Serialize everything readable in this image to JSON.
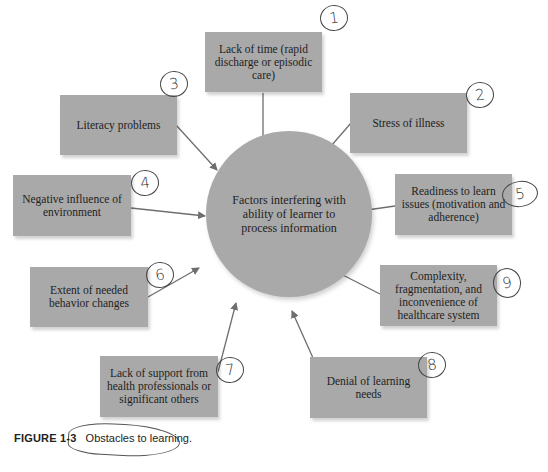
{
  "diagram": {
    "center": "Factors interfering with ability of learner to process information",
    "factors": [
      {
        "number": "1",
        "label": "Lack of time (rapid discharge or episodic care)"
      },
      {
        "number": "2",
        "label": "Stress of illness"
      },
      {
        "number": "3",
        "label": "Literacy problems"
      },
      {
        "number": "4",
        "label": "Negative influence of environment"
      },
      {
        "number": "5",
        "label": "Readiness to learn issues (motivation and adherence)"
      },
      {
        "number": "6",
        "label": "Extent of needed behavior changes"
      },
      {
        "number": "7",
        "label": "Lack of support from health professionals or significant others"
      },
      {
        "number": "8",
        "label": "Denial of learning needs"
      },
      {
        "number": "9",
        "label": "Complexity, fragmentation, and inconvenience of healthcare system"
      }
    ]
  },
  "caption": {
    "figure_label": "FIGURE 1-3",
    "text": "Obstacles to learning."
  },
  "colors": {
    "box_fill": "#a9a9a9",
    "arrow": "#6e6e6e",
    "text": "#1e1e1e"
  }
}
